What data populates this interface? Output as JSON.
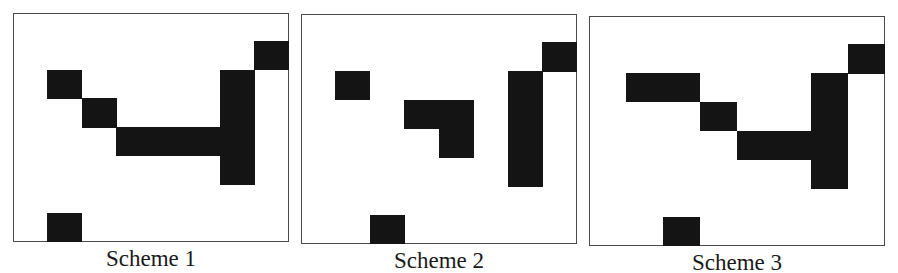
{
  "figure": {
    "grid": {
      "columns": 8,
      "rows": 8
    },
    "colors": {
      "filled": "#141414",
      "frame": "#4a4a4a",
      "background": "#ffffff"
    },
    "panels": [
      {
        "caption": "Scheme 1",
        "frame": {
          "left": 13,
          "top": 13,
          "right": 289,
          "bottom": 242
        },
        "filled_cells": [
          [
            7,
            1
          ],
          [
            1,
            2
          ],
          [
            6,
            2
          ],
          [
            2,
            3
          ],
          [
            6,
            3
          ],
          [
            3,
            4
          ],
          [
            4,
            4
          ],
          [
            5,
            4
          ],
          [
            6,
            4
          ],
          [
            6,
            5
          ],
          [
            1,
            7
          ]
        ]
      },
      {
        "caption": "Scheme 2",
        "frame": {
          "left": 301,
          "top": 14,
          "right": 577,
          "bottom": 244
        },
        "filled_cells": [
          [
            7,
            1
          ],
          [
            1,
            2
          ],
          [
            6,
            2
          ],
          [
            3,
            3
          ],
          [
            4,
            3
          ],
          [
            6,
            3
          ],
          [
            4,
            4
          ],
          [
            6,
            4
          ],
          [
            6,
            5
          ],
          [
            2,
            7
          ]
        ]
      },
      {
        "caption": "Scheme 3",
        "frame": {
          "left": 589,
          "top": 16,
          "right": 885,
          "bottom": 246
        },
        "filled_cells": [
          [
            7,
            1
          ],
          [
            1,
            2
          ],
          [
            2,
            2
          ],
          [
            6,
            2
          ],
          [
            3,
            3
          ],
          [
            6,
            3
          ],
          [
            4,
            4
          ],
          [
            5,
            4
          ],
          [
            6,
            4
          ],
          [
            6,
            5
          ],
          [
            2,
            7
          ]
        ]
      }
    ]
  }
}
